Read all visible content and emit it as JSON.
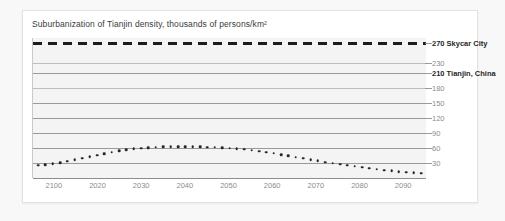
{
  "card": {
    "title": "Suburbanization of Tianjin density, thousands of persons/km²"
  },
  "chart_data": {
    "type": "line",
    "title": "Suburbanization of Tianjin density, thousands of persons/km²",
    "xlabel": "",
    "ylabel": "thousands of persons/km²",
    "ylim": [
      0,
      280
    ],
    "xlim": [
      2100,
      2095
    ],
    "grid": true,
    "legend_position": "right-axis-labels",
    "y_ticks": [
      30,
      60,
      90,
      120,
      150,
      180,
      210,
      230,
      270
    ],
    "y_tick_labels": [
      "30",
      "60",
      "90",
      "120",
      "150",
      "180",
      "210 Tianjin, China",
      "230",
      "270 Skycar City"
    ],
    "x_tick_labels": [
      "2100",
      "2020",
      "2030",
      "2040",
      "2050",
      "2060",
      "2070",
      "2080",
      "2090"
    ],
    "reference_lines": [
      {
        "name": "Skycar City",
        "value": 270,
        "label": "270 Skycar City",
        "style": "dashed",
        "emphasis": "bold"
      },
      {
        "name": "Tianjin, China",
        "value": 210,
        "label": "210 Tianjin, China",
        "style": "solid",
        "emphasis": "bold"
      }
    ],
    "series": [
      {
        "name": "Tianjin density",
        "style": "dotted",
        "x": [
          "2100",
          "2020",
          "2030",
          "2040",
          "2050",
          "2060",
          "2070",
          "2080",
          "2090"
        ],
        "values": [
          28,
          45,
          60,
          65,
          64,
          55,
          40,
          25,
          13
        ]
      }
    ],
    "points": [
      28,
      29,
      31,
      33,
      36,
      39,
      42,
      45,
      48,
      51,
      54,
      57,
      59,
      61,
      62,
      63,
      64,
      65,
      65,
      65,
      65,
      65,
      65,
      64,
      64,
      63,
      62,
      61,
      60,
      58,
      56,
      54,
      52,
      49,
      47,
      44,
      42,
      39,
      37,
      34,
      32,
      30,
      28,
      26,
      24,
      22,
      20,
      18,
      17,
      15,
      14,
      13,
      12
    ]
  },
  "axis_labels_right": [
    {
      "value": 270,
      "text": "270 Skycar City",
      "bold": true
    },
    {
      "value": 230,
      "text": "230",
      "bold": false
    },
    {
      "value": 210,
      "text": "210 Tianjin, China",
      "bold": true
    },
    {
      "value": 180,
      "text": "180",
      "bold": false
    },
    {
      "value": 150,
      "text": "150",
      "bold": false
    },
    {
      "value": 120,
      "text": "120",
      "bold": false
    },
    {
      "value": 90,
      "text": "90",
      "bold": false
    },
    {
      "value": 60,
      "text": "60",
      "bold": false
    },
    {
      "value": 30,
      "text": "30",
      "bold": false
    }
  ],
  "colors": {
    "page_background": "#f8f8f8",
    "card_background": "#ffffff",
    "plot_background": "#f4f4f4",
    "gridline": "#9a9a9a",
    "data": "#272727",
    "label_muted": "#8c8c8c",
    "label_strong": "#1f1f1f"
  }
}
